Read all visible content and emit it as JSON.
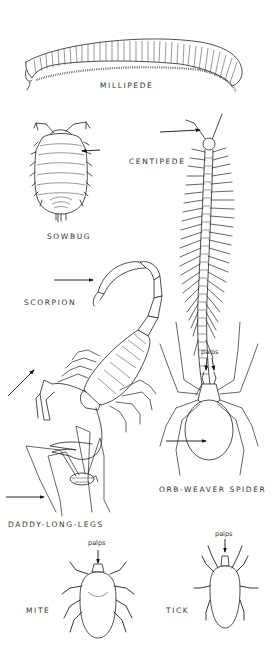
{
  "figure": {
    "type": "illustration",
    "background": "#ffffff",
    "line_color": "#222222"
  },
  "labels": {
    "millipede": "MILLIPEDE",
    "sowbug": "SOWBUG",
    "centipede": "CENTIPEDE",
    "scorpion": "SCORPION",
    "orb_weaver": "ORB-WEAVER SPIDER",
    "daddy_long_legs": "DADDY-LONG-LEGS",
    "mite": "MITE",
    "tick": "TICK"
  },
  "annotations": {
    "palps_spider": "palps",
    "palps_mite": "palps",
    "palps_tick": "palps"
  }
}
